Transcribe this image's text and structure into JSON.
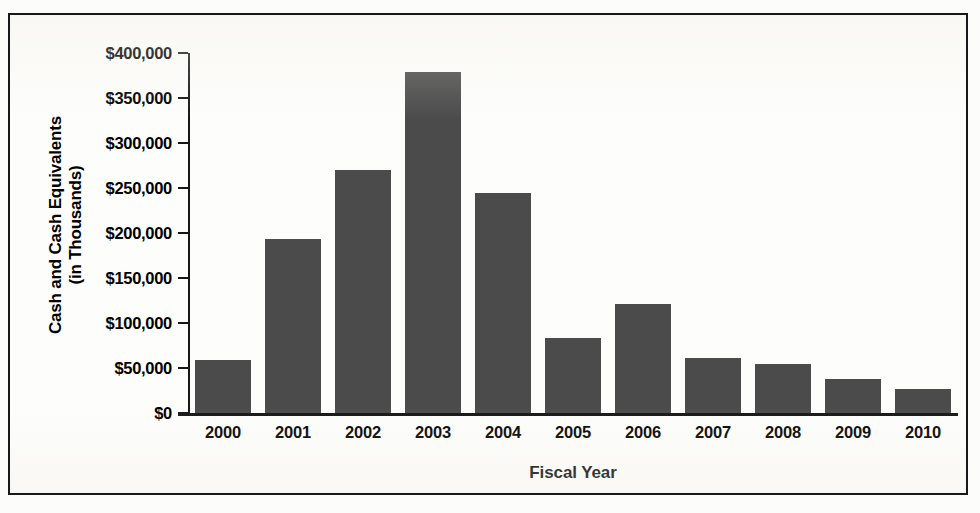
{
  "chart_data": {
    "type": "bar",
    "title": "",
    "xlabel": "Fiscal Year",
    "ylabel": "Cash and Cash Equivalents (in Thousands)",
    "ylabel_line1": "Cash and Cash Equivalents",
    "ylabel_line2": "(in Thousands)",
    "categories": [
      "2000",
      "2001",
      "2002",
      "2003",
      "2004",
      "2005",
      "2006",
      "2007",
      "2008",
      "2009",
      "2010"
    ],
    "values": [
      59000,
      193000,
      270000,
      379000,
      245000,
      83000,
      121000,
      61000,
      55000,
      38000,
      27000
    ],
    "ylim": [
      0,
      400000
    ],
    "ytick_values": [
      0,
      50000,
      100000,
      150000,
      200000,
      250000,
      300000,
      350000,
      400000
    ],
    "ytick_labels": [
      "$0",
      "$50,000",
      "$100,000",
      "$150,000",
      "$200,000",
      "$250,000",
      "$300,000",
      "$350,000",
      "$400,000"
    ],
    "grid": false,
    "legend": false,
    "bar_color": "#4b4b4b",
    "axis_color": "#141618",
    "background_color": "#fdfdfb"
  }
}
